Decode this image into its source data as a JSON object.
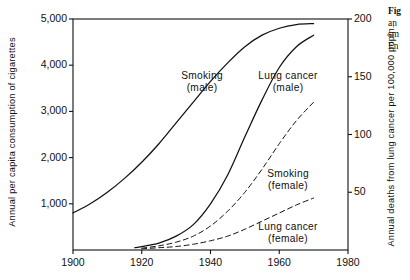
{
  "figure": {
    "background": "#ffffff",
    "ink": "#111111"
  },
  "caption": {
    "head": "Fig",
    "lines": [
      "an",
      "sm",
      "En"
    ]
  },
  "axes": {
    "left": {
      "title": "Annual per capita consumption of cigarettes",
      "ticks": [
        "5,000",
        "4,000",
        "3,000",
        "2,000",
        "1,000"
      ],
      "tick_values": [
        5000,
        4000,
        3000,
        2000,
        1000
      ],
      "range": [
        0,
        5000
      ]
    },
    "right": {
      "title": "Annual deaths from lung cancer per 100,000 popln.",
      "ticks": [
        "200",
        "150",
        "100",
        "50"
      ],
      "tick_values": [
        200,
        150,
        100,
        50
      ],
      "range": [
        0,
        200
      ]
    },
    "bottom": {
      "title": "",
      "ticks": [
        "1900",
        "1920",
        "1940",
        "1960",
        "1980"
      ],
      "tick_values": [
        1900,
        1920,
        1940,
        1960,
        1980
      ],
      "range": [
        1900,
        1980
      ]
    }
  },
  "curve_labels": [
    {
      "name": "smoking-male",
      "line1": "Smoking",
      "line2": "(male)",
      "x": 202,
      "y": 77
    },
    {
      "name": "lung-cancer-male",
      "line1": "Lung cancer",
      "line2": "(male)",
      "x": 288,
      "y": 77
    },
    {
      "name": "smoking-female",
      "line1": "Smoking",
      "line2": "(female)",
      "x": 288,
      "y": 175
    },
    {
      "name": "lung-cancer-female",
      "line1": "Lung cancer",
      "line2": "(female)",
      "x": 288,
      "y": 228
    }
  ],
  "chart_data": {
    "type": "line",
    "title": "",
    "xlabel": "",
    "ylabel": "Annual per capita consumption of cigarettes",
    "y2label": "Annual deaths from lung cancer per 100,000 popln.",
    "xlim": [
      1900,
      1980
    ],
    "ylim": [
      0,
      5000
    ],
    "y2lim": [
      0,
      200
    ],
    "grid": false,
    "legend": "inline-labels",
    "xticks": [
      1900,
      1920,
      1940,
      1960,
      1980
    ],
    "yticks": [
      1000,
      2000,
      3000,
      4000,
      5000
    ],
    "y2ticks": [
      50,
      100,
      150,
      200
    ],
    "series": [
      {
        "name": "Smoking (male)",
        "axis": "left",
        "style": "solid",
        "color": "#111111",
        "x": [
          1900,
          1905,
          1910,
          1915,
          1920,
          1925,
          1930,
          1935,
          1940,
          1945,
          1950,
          1955,
          1960,
          1965,
          1970
        ],
        "values": [
          800,
          1000,
          1250,
          1550,
          1900,
          2300,
          2750,
          3200,
          3650,
          4050,
          4400,
          4650,
          4800,
          4880,
          4900
        ]
      },
      {
        "name": "Lung cancer (male)",
        "axis": "right",
        "style": "solid",
        "color": "#111111",
        "x": [
          1918,
          1920,
          1925,
          1930,
          1935,
          1940,
          1945,
          1950,
          1955,
          1960,
          1965,
          1970
        ],
        "values": [
          2,
          3,
          6,
          12,
          22,
          40,
          65,
          98,
          130,
          158,
          176,
          186
        ]
      },
      {
        "name": "Smoking (female)",
        "axis": "left",
        "style": "dashed",
        "color": "#111111",
        "x": [
          1920,
          1925,
          1930,
          1935,
          1940,
          1945,
          1950,
          1955,
          1960,
          1965,
          1970
        ],
        "values": [
          40,
          90,
          170,
          300,
          520,
          840,
          1250,
          1750,
          2300,
          2800,
          3200
        ]
      },
      {
        "name": "Lung cancer (female)",
        "axis": "right",
        "style": "dashed",
        "color": "#111111",
        "x": [
          1920,
          1925,
          1930,
          1935,
          1940,
          1945,
          1950,
          1955,
          1960,
          1965,
          1970
        ],
        "values": [
          1,
          2,
          3,
          5,
          8,
          12,
          18,
          25,
          32,
          39,
          45
        ]
      }
    ]
  }
}
